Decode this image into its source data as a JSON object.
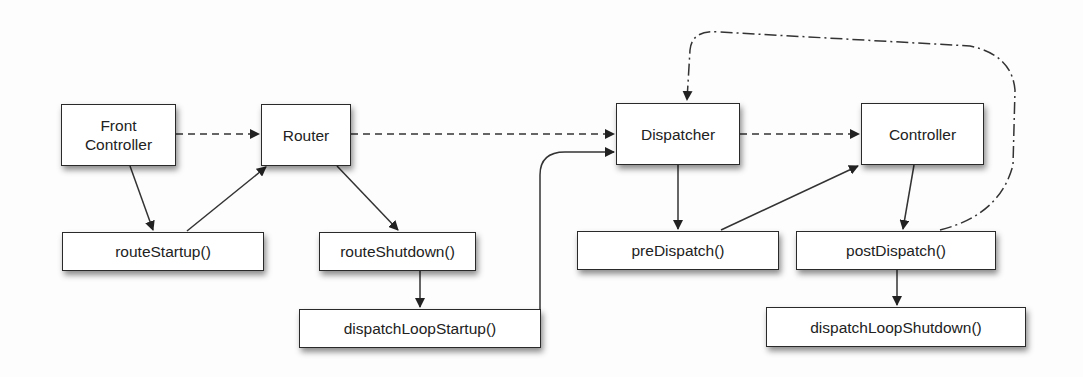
{
  "diagram": {
    "type": "flow",
    "colors": {
      "line": "#222222",
      "box_border": "#2a2a2a",
      "box_fill": "#ffffff",
      "background": "#fdfdfd"
    },
    "nodes": {
      "front_controller": {
        "label": "Front\nController"
      },
      "router": {
        "label": "Router"
      },
      "dispatcher": {
        "label": "Dispatcher"
      },
      "controller": {
        "label": "Controller"
      },
      "route_startup": {
        "label": "routeStartup()"
      },
      "route_shutdown": {
        "label": "routeShutdown()"
      },
      "dispatch_loop_startup": {
        "label": "dispatchLoopStartup()"
      },
      "pre_dispatch": {
        "label": "preDispatch()"
      },
      "post_dispatch": {
        "label": "postDispatch()"
      },
      "dispatch_loop_shutdown": {
        "label": "dispatchLoopShutdown()"
      }
    },
    "edges": [
      {
        "from": "Front Controller",
        "to": "Router",
        "style": "dashed"
      },
      {
        "from": "Router",
        "to": "Dispatcher",
        "style": "dashed"
      },
      {
        "from": "Dispatcher",
        "to": "Controller",
        "style": "dashed"
      },
      {
        "from": "Front Controller",
        "to": "routeStartup()",
        "style": "solid"
      },
      {
        "from": "routeStartup()",
        "to": "Router",
        "style": "solid"
      },
      {
        "from": "Router",
        "to": "routeShutdown()",
        "style": "solid"
      },
      {
        "from": "routeShutdown()",
        "to": "dispatchLoopStartup()",
        "style": "solid"
      },
      {
        "from": "dispatchLoopStartup()",
        "to": "Dispatcher",
        "style": "solid"
      },
      {
        "from": "Dispatcher",
        "to": "preDispatch()",
        "style": "solid"
      },
      {
        "from": "preDispatch()",
        "to": "Controller",
        "style": "solid"
      },
      {
        "from": "Controller",
        "to": "postDispatch()",
        "style": "solid"
      },
      {
        "from": "postDispatch()",
        "to": "dispatchLoopShutdown()",
        "style": "solid"
      },
      {
        "from": "postDispatch()",
        "to": "Dispatcher",
        "style": "dash-dot"
      }
    ]
  }
}
